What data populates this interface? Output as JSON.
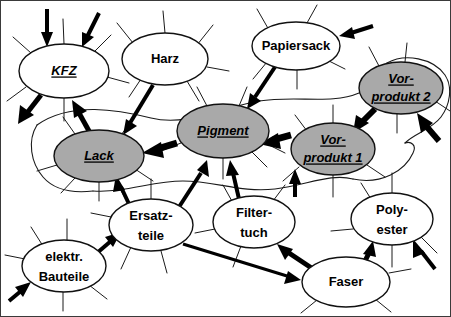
{
  "diagram": {
    "background_color": "#ffffff",
    "border_color": "#3a3a3a",
    "highlight_fill": "#a9a9a9",
    "plain_fill": "#ffffff",
    "line_color": "#111111",
    "nodes": [
      {
        "id": "kfz",
        "label": "KFZ",
        "lines": [
          "KFZ"
        ],
        "style": "emph",
        "fill": "plain",
        "cx": 63,
        "cy": 70,
        "rx": 45,
        "ry": 27
      },
      {
        "id": "harz",
        "label": "Harz",
        "lines": [
          "Harz"
        ],
        "style": "plain",
        "fill": "plain",
        "cx": 164,
        "cy": 58,
        "rx": 43,
        "ry": 26
      },
      {
        "id": "papiersack",
        "label": "Papiersack",
        "lines": [
          "Papiersack"
        ],
        "style": "plain",
        "fill": "plain",
        "cx": 295,
        "cy": 45,
        "rx": 44,
        "ry": 24
      },
      {
        "id": "vorprodukt2",
        "label": "Vor-produkt 2",
        "lines": [
          "Vor-",
          "produkt 2"
        ],
        "style": "emph",
        "fill": "highlight",
        "cx": 400,
        "cy": 87,
        "rx": 42,
        "ry": 26
      },
      {
        "id": "pigment",
        "label": "Pigment",
        "lines": [
          "Pigment"
        ],
        "style": "emph",
        "fill": "highlight",
        "cx": 222,
        "cy": 130,
        "rx": 46,
        "ry": 27
      },
      {
        "id": "lack",
        "label": "Lack",
        "lines": [
          "Lack"
        ],
        "style": "emph",
        "fill": "highlight",
        "cx": 98,
        "cy": 155,
        "rx": 45,
        "ry": 26
      },
      {
        "id": "vorprodukt1",
        "label": "Vor-produkt 1",
        "lines": [
          "Vor-",
          "produkt 1"
        ],
        "style": "emph",
        "fill": "highlight",
        "cx": 332,
        "cy": 148,
        "rx": 42,
        "ry": 26
      },
      {
        "id": "ersatzteile",
        "label": "Ersatz-teile",
        "lines": [
          "Ersatz-",
          "teile"
        ],
        "style": "plain",
        "fill": "plain",
        "cx": 150,
        "cy": 224,
        "rx": 42,
        "ry": 26
      },
      {
        "id": "filtertuch",
        "label": "Filter-tuch",
        "lines": [
          "Filter-",
          "tuch"
        ],
        "style": "plain",
        "fill": "plain",
        "cx": 253,
        "cy": 221,
        "rx": 41,
        "ry": 26
      },
      {
        "id": "polyester",
        "label": "Poly-ester",
        "lines": [
          "Poly-",
          "ester"
        ],
        "style": "plain",
        "fill": "plain",
        "cx": 391,
        "cy": 218,
        "rx": 41,
        "ry": 26
      },
      {
        "id": "elektrbauteile",
        "label": "elektr. Bauteile",
        "lines": [
          "elektr.",
          "Bauteile"
        ],
        "style": "plain",
        "fill": "plain",
        "cx": 63,
        "cy": 265,
        "rx": 42,
        "ry": 26
      },
      {
        "id": "faser",
        "label": "Faser",
        "lines": [
          "Faser"
        ],
        "style": "plain",
        "fill": "plain",
        "cx": 345,
        "cy": 281,
        "rx": 44,
        "ry": 25
      }
    ],
    "flows": [
      {
        "from": "external",
        "to": "kfz",
        "label": ""
      },
      {
        "from": "external",
        "to": "kfz",
        "label": ""
      },
      {
        "from": "kfz",
        "to": "external",
        "label": ""
      },
      {
        "from": "lack",
        "to": "kfz",
        "label": ""
      },
      {
        "from": "harz",
        "to": "lack",
        "label": ""
      },
      {
        "from": "pigment",
        "to": "lack",
        "label": ""
      },
      {
        "from": "papiersack",
        "to": "pigment",
        "label": ""
      },
      {
        "from": "external",
        "to": "papiersack",
        "label": ""
      },
      {
        "from": "vorprodukt1",
        "to": "pigment",
        "label": ""
      },
      {
        "from": "vorprodukt2",
        "to": "vorprodukt1",
        "label": ""
      },
      {
        "from": "external",
        "to": "vorprodukt2",
        "label": ""
      },
      {
        "from": "ersatzteile",
        "to": "pigment",
        "label": ""
      },
      {
        "from": "filtertuch",
        "to": "pigment",
        "label": ""
      },
      {
        "from": "ersatzteile",
        "to": "lack",
        "label": ""
      },
      {
        "from": "elektrbauteile",
        "to": "ersatzteile",
        "label": ""
      },
      {
        "from": "external",
        "to": "elektrbauteile",
        "label": ""
      },
      {
        "from": "ersatzteile",
        "to": "faser",
        "label": ""
      },
      {
        "from": "faser",
        "to": "filtertuch",
        "label": ""
      },
      {
        "from": "faser",
        "to": "polyester",
        "label": ""
      },
      {
        "from": "external",
        "to": "polyester",
        "label": ""
      },
      {
        "from": "vorprodukt1",
        "to": "filtertuch",
        "label": ""
      }
    ]
  }
}
